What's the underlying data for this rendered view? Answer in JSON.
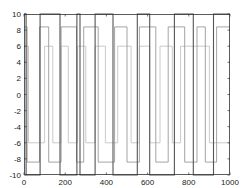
{
  "chart_data": {
    "type": "line",
    "title": "",
    "xlabel": "",
    "ylabel": "",
    "xlim": [
      0,
      1000
    ],
    "ylim": [
      -10,
      10
    ],
    "grid": false,
    "legend": null,
    "x_ticks": [
      0,
      200,
      400,
      600,
      800,
      1000
    ],
    "y_ticks": [
      -10,
      -8,
      -6,
      -4,
      -2,
      0,
      2,
      4,
      6,
      8,
      10
    ],
    "x_tick_labels": [
      "0",
      "200",
      "400",
      "600",
      "800",
      "1000"
    ],
    "y_tick_labels": [
      "-10",
      "-8",
      "-6",
      "-4",
      "-2",
      "0",
      "2",
      "4",
      "6",
      "8",
      "10"
    ],
    "series": [
      {
        "name": "series-1",
        "color": "#555555",
        "style": "step",
        "amplitude": 10,
        "x": [
          0,
          10,
          78,
          175,
          257,
          272,
          345,
          432,
          550,
          610,
          730,
          822,
          920,
          1000
        ],
        "y": [
          10,
          -10,
          10,
          -10,
          10,
          -10,
          10,
          -10,
          10,
          -10,
          10,
          -10,
          10,
          10
        ]
      },
      {
        "name": "series-2",
        "color": "#9a9a9a",
        "style": "step",
        "amplitude": 8.4,
        "x": [
          0,
          15,
          75,
          120,
          180,
          255,
          290,
          360,
          440,
          500,
          560,
          640,
          700,
          780,
          840,
          880,
          935,
          1000
        ],
        "y": [
          8.4,
          -8.4,
          8.4,
          -8.4,
          8.4,
          -8.4,
          8.4,
          -8.4,
          8.4,
          -8.4,
          8.4,
          -8.4,
          8.4,
          -8.4,
          8.4,
          -8.4,
          8.4,
          8.4
        ]
      },
      {
        "name": "series-3",
        "color": "#c4c4c4",
        "style": "step",
        "amplitude": 6,
        "x": [
          0,
          22,
          100,
          140,
          180,
          215,
          260,
          300,
          345,
          395,
          455,
          520,
          560,
          610,
          660,
          720,
          760,
          900,
          1000
        ],
        "y": [
          6,
          -6,
          6,
          -6,
          6,
          -6,
          6,
          -6,
          6,
          -6,
          6,
          -6,
          6,
          -6,
          6,
          -6,
          6,
          -6,
          -6
        ]
      }
    ]
  },
  "axes": {
    "plot_left": 24,
    "plot_right": 230,
    "plot_top": 14,
    "plot_bottom": 175,
    "frame_color": "#333333",
    "background": "#ffffff"
  }
}
